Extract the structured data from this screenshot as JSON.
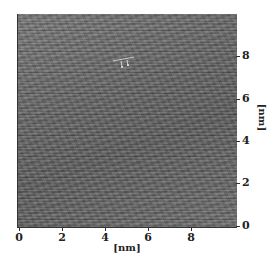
{
  "figure": {
    "type": "scanning-probe-micrograph",
    "x_axis": {
      "label": "[nm]",
      "ticks": [
        "0",
        "2",
        "4",
        "6",
        "8"
      ]
    },
    "y_axis": {
      "label": "[nm]",
      "ticks": [
        "0",
        "2",
        "4",
        "6",
        "8"
      ]
    },
    "caption": "",
    "colors": {
      "surface_gray": "#6c6c6c",
      "axis": "#333333",
      "marker": "#e6e6e6"
    }
  }
}
